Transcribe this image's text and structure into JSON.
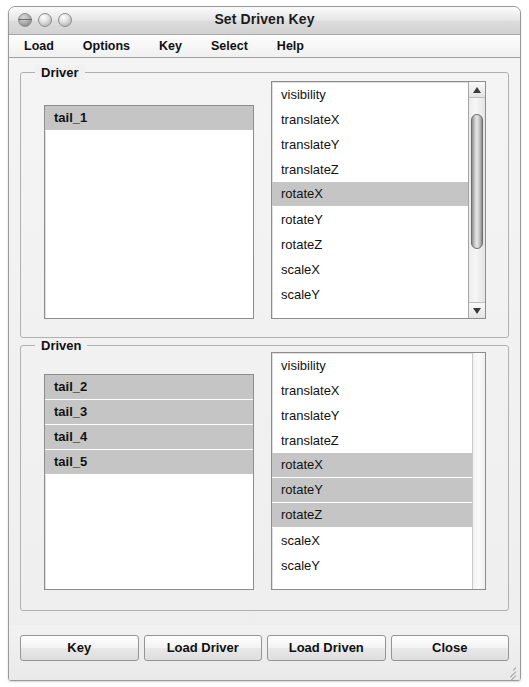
{
  "window": {
    "title": "Set Driven Key",
    "traffic_lights": [
      {
        "name": "close-button",
        "label": "close"
      },
      {
        "name": "minimize-button",
        "label": "minimize"
      },
      {
        "name": "zoom-button",
        "label": "zoom"
      }
    ]
  },
  "menubar": {
    "items": [
      {
        "label": "Load"
      },
      {
        "label": "Options"
      },
      {
        "label": "Key"
      },
      {
        "label": "Select"
      },
      {
        "label": "Help"
      }
    ]
  },
  "driver": {
    "title": "Driver",
    "objects": [
      {
        "label": "tail_1",
        "selected": true
      }
    ],
    "attributes": [
      {
        "label": "visibility",
        "selected": false
      },
      {
        "label": "translateX",
        "selected": false
      },
      {
        "label": "translateY",
        "selected": false
      },
      {
        "label": "translateZ",
        "selected": false
      },
      {
        "label": "rotateX",
        "selected": true
      },
      {
        "label": "rotateY",
        "selected": false
      },
      {
        "label": "rotateZ",
        "selected": false
      },
      {
        "label": "scaleX",
        "selected": false
      },
      {
        "label": "scaleY",
        "selected": false
      }
    ],
    "scrollbar": {
      "visible": true,
      "thumb_top_pct": 8,
      "thumb_height_pct": 66
    }
  },
  "driven": {
    "title": "Driven",
    "objects": [
      {
        "label": "tail_2",
        "selected": true
      },
      {
        "label": "tail_3",
        "selected": true
      },
      {
        "label": "tail_4",
        "selected": true
      },
      {
        "label": "tail_5",
        "selected": true
      }
    ],
    "attributes": [
      {
        "label": "visibility",
        "selected": false
      },
      {
        "label": "translateX",
        "selected": false
      },
      {
        "label": "translateY",
        "selected": false
      },
      {
        "label": "translateZ",
        "selected": false
      },
      {
        "label": "rotateX",
        "selected": true
      },
      {
        "label": "rotateY",
        "selected": true
      },
      {
        "label": "rotateZ",
        "selected": true
      },
      {
        "label": "scaleX",
        "selected": false
      },
      {
        "label": "scaleY",
        "selected": false
      }
    ],
    "scrollbar": {
      "visible": false
    }
  },
  "footer": {
    "buttons": [
      {
        "label": "Key",
        "name": "key-button"
      },
      {
        "label": "Load Driver",
        "name": "load-driver-button"
      },
      {
        "label": "Load Driven",
        "name": "load-driven-button"
      },
      {
        "label": "Close",
        "name": "close-dialog-button"
      }
    ]
  },
  "colors": {
    "selection": "#c5c5c5",
    "window_bg": "#f1f1f1",
    "pane_bg": "#ffffff",
    "border": "#8d8d8d"
  }
}
